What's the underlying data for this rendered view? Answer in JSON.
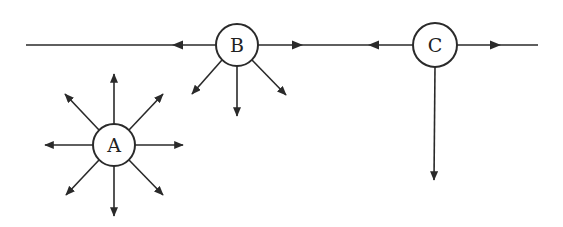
{
  "diagram": {
    "type": "node-arrow-diagram",
    "colors": {
      "stroke": "#2a2a2a",
      "background": "#ffffff",
      "text": "#222222"
    },
    "nodes": [
      {
        "id": "A",
        "label": "A",
        "cx": 114,
        "cy": 145,
        "r": 21
      },
      {
        "id": "B",
        "label": "B",
        "cx": 237,
        "cy": 45,
        "r": 21
      },
      {
        "id": "C",
        "label": "C",
        "cx": 435,
        "cy": 45,
        "r": 22
      }
    ],
    "lines": [
      {
        "name": "main-line-left-of-b",
        "x1": 26,
        "y1": 45,
        "x2": 216,
        "y2": 45
      },
      {
        "name": "line-b-to-c",
        "x1": 258,
        "y1": 45,
        "x2": 413,
        "y2": 45
      },
      {
        "name": "line-right-of-c",
        "x1": 457,
        "y1": 45,
        "x2": 538,
        "y2": 45
      }
    ],
    "arrows": [
      {
        "name": "b-left-arrow",
        "from": "B",
        "x1": 216,
        "y1": 45,
        "x2": 172,
        "y2": 45,
        "head": [
          172,
          45
        ],
        "mid": true
      },
      {
        "name": "b-right-arrow",
        "from": "B",
        "x1": 258,
        "y1": 45,
        "x2": 303,
        "y2": 45,
        "head": [
          303,
          45
        ],
        "mid": true
      },
      {
        "name": "c-left-arrow",
        "from": "C",
        "x1": 413,
        "y1": 45,
        "x2": 368,
        "y2": 45,
        "head": [
          368,
          45
        ],
        "mid": true
      },
      {
        "name": "c-right-arrow",
        "from": "C",
        "x1": 457,
        "y1": 45,
        "x2": 501,
        "y2": 45,
        "head": [
          501,
          45
        ],
        "mid": true
      },
      {
        "name": "c-down-arrow",
        "from": "C",
        "x1": 435,
        "y1": 67,
        "x2": 434,
        "y2": 180
      },
      {
        "name": "b-down-left-arrow",
        "from": "B",
        "x1": 222,
        "y1": 60,
        "x2": 192,
        "y2": 94
      },
      {
        "name": "b-down-arrow",
        "from": "B",
        "x1": 237,
        "y1": 66,
        "x2": 237,
        "y2": 116
      },
      {
        "name": "b-down-right-arrow",
        "from": "B",
        "x1": 252,
        "y1": 60,
        "x2": 286,
        "y2": 95
      },
      {
        "name": "a-up-arrow",
        "from": "A",
        "x1": 114,
        "y1": 124,
        "x2": 114,
        "y2": 74
      },
      {
        "name": "a-up-left-arrow",
        "from": "A",
        "x1": 99,
        "y1": 130,
        "x2": 65,
        "y2": 94
      },
      {
        "name": "a-up-right-arrow",
        "from": "A",
        "x1": 129,
        "y1": 130,
        "x2": 163,
        "y2": 94
      },
      {
        "name": "a-left-arrow",
        "from": "A",
        "x1": 93,
        "y1": 145,
        "x2": 45,
        "y2": 145
      },
      {
        "name": "a-right-arrow",
        "from": "A",
        "x1": 135,
        "y1": 145,
        "x2": 183,
        "y2": 145
      },
      {
        "name": "a-down-left-arrow",
        "from": "A",
        "x1": 99,
        "y1": 160,
        "x2": 66,
        "y2": 195
      },
      {
        "name": "a-down-arrow",
        "from": "A",
        "x1": 114,
        "y1": 166,
        "x2": 114,
        "y2": 216
      },
      {
        "name": "a-down-right-arrow",
        "from": "A",
        "x1": 129,
        "y1": 160,
        "x2": 163,
        "y2": 195
      }
    ]
  }
}
